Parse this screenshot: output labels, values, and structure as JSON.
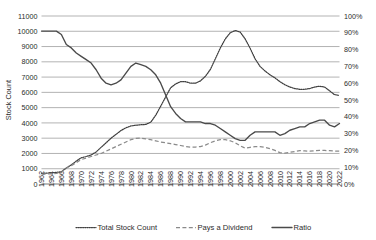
{
  "chart_data": {
    "type": "line",
    "title": "",
    "xlabel": "",
    "ylabel": "Stock Count",
    "y2label": "",
    "ylim": [
      0,
      11000
    ],
    "y2lim": [
      0,
      100
    ],
    "ytick_step": 1000,
    "y2tick_step": 10,
    "grid": true,
    "legend_position": "bottom",
    "x": [
      1962,
      1963,
      1964,
      1965,
      1966,
      1967,
      1968,
      1969,
      1970,
      1971,
      1972,
      1973,
      1974,
      1975,
      1976,
      1977,
      1978,
      1979,
      1980,
      1981,
      1982,
      1983,
      1984,
      1985,
      1986,
      1987,
      1988,
      1989,
      1990,
      1991,
      1992,
      1993,
      1994,
      1995,
      1996,
      1997,
      1998,
      1999,
      2000,
      2001,
      2002,
      2003,
      2004,
      2005,
      2006,
      2007,
      2008,
      2009,
      2010,
      2011,
      2012,
      2013,
      2014,
      2015,
      2016,
      2017,
      2018,
      2019,
      2020,
      2021,
      2022
    ],
    "xtick_labels": [
      "1962",
      "1964",
      "1966",
      "1968",
      "1970",
      "1972",
      "1974",
      "1976",
      "1978",
      "1980",
      "1982",
      "1984",
      "1986",
      "1988",
      "1990",
      "1992",
      "1994",
      "1996",
      "1998",
      "2000",
      "2002",
      "2004",
      "2006",
      "2008",
      "2010",
      "2012",
      "2014",
      "2016",
      "2018",
      "2020",
      "2022"
    ],
    "ytick_labels": [
      "0",
      "1000",
      "2000",
      "3000",
      "4000",
      "5000",
      "6000",
      "7000",
      "8000",
      "9000",
      "10000",
      "11000"
    ],
    "y2tick_labels": [
      "0%",
      "10%",
      "20%",
      "30%",
      "40%",
      "50%",
      "60%",
      "70%",
      "80%",
      "90%",
      "100%"
    ],
    "series": [
      {
        "name": "Total Stock Count",
        "style": "dotted",
        "axis": "left",
        "color": "#3f3f3f",
        "values": [
          700,
          710,
          730,
          760,
          800,
          1050,
          1250,
          1500,
          1720,
          1800,
          1900,
          2100,
          2400,
          2700,
          3000,
          3250,
          3500,
          3680,
          3800,
          3850,
          3880,
          3900,
          4050,
          4500,
          5100,
          5700,
          6300,
          6550,
          6700,
          6700,
          6600,
          6600,
          6750,
          7050,
          7500,
          8200,
          8900,
          9500,
          9900,
          10050,
          9950,
          9500,
          8900,
          8200,
          7700,
          7400,
          7150,
          6950,
          6700,
          6500,
          6350,
          6250,
          6200,
          6200,
          6250,
          6350,
          6400,
          6350,
          6100,
          5850,
          5800
        ]
      },
      {
        "name": "Pays a Dividend",
        "style": "dashed",
        "axis": "left",
        "color": "#8a8a8a",
        "values": [
          640,
          650,
          670,
          700,
          760,
          1050,
          1200,
          1400,
          1600,
          1700,
          1800,
          1900,
          2000,
          2150,
          2300,
          2450,
          2600,
          2750,
          2900,
          2980,
          3000,
          2960,
          2900,
          2830,
          2750,
          2700,
          2640,
          2580,
          2520,
          2450,
          2420,
          2420,
          2450,
          2550,
          2700,
          2830,
          2900,
          2900,
          2830,
          2700,
          2500,
          2350,
          2400,
          2450,
          2450,
          2400,
          2320,
          2200,
          2050,
          2020,
          2080,
          2130,
          2180,
          2170,
          2150,
          2180,
          2200,
          2200,
          2180,
          2160,
          2150
        ]
      },
      {
        "name": "Ratio",
        "style": "solid",
        "axis": "right",
        "color": "#4a4a4a",
        "values_percent": [
          91,
          91,
          91,
          91,
          89,
          83,
          81,
          78,
          76,
          74,
          72,
          68,
          63,
          60,
          59,
          60,
          62,
          66,
          70,
          72,
          71,
          70,
          68,
          65,
          60,
          53,
          46,
          42,
          39,
          37,
          37,
          37,
          37,
          36,
          36,
          35,
          33,
          31,
          29,
          27,
          26,
          26,
          29,
          31,
          31,
          31,
          31,
          31,
          29,
          30,
          32,
          33,
          34,
          34,
          36,
          37,
          38,
          38,
          35,
          34,
          36
        ]
      }
    ],
    "legend": [
      {
        "label": "Total Stock Count",
        "style": "dotted"
      },
      {
        "label": "Pays a Dividend",
        "style": "dashed"
      },
      {
        "label": "Ratio",
        "style": "solid"
      }
    ]
  }
}
